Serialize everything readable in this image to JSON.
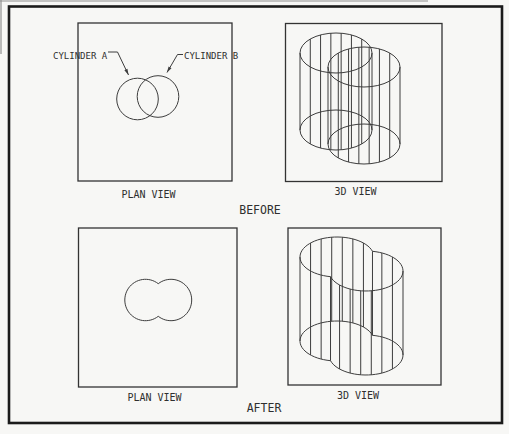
{
  "labels": {
    "cylinder_a": "CYLINDER A",
    "cylinder_b": "CYLINDER B"
  },
  "captions": {
    "before_plan": "PLAN VIEW",
    "before_3d": "3D VIEW",
    "before": "BEFORE",
    "after_plan": "PLAN VIEW",
    "after_3d": "3D VIEW",
    "after": "AFTER"
  },
  "colors": {
    "line": "#3d3d3d",
    "frame": "#333333",
    "border": "#1b1b1b",
    "background": "#f7f7f5",
    "text": "#2f2f2f"
  },
  "geometry": {
    "canvas": {
      "w": 509,
      "h": 434
    },
    "border": {
      "x": 9,
      "y": 6.5,
      "w": 493,
      "h": 416.5
    },
    "panels": {
      "before_plan": {
        "x": 78,
        "y": 23,
        "w": 154,
        "h": 158
      },
      "before_3d": {
        "x": 285.5,
        "y": 23.5,
        "w": 156.5,
        "h": 158
      },
      "after_plan": {
        "x": 78.5,
        "y": 228,
        "w": 158.5,
        "h": 159
      },
      "after_3d": {
        "x": 288,
        "y": 228,
        "w": 153,
        "h": 157
      }
    },
    "before_plan": {
      "circles": [
        {
          "cx": 137.5,
          "cy": 99,
          "r": 20.8
        },
        {
          "cx": 158,
          "cy": 96.5,
          "r": 20.8
        }
      ]
    },
    "after_plan": {
      "union": true,
      "circles": [
        {
          "cx": 145.5,
          "cy": 300,
          "r": 20.7
        },
        {
          "cx": 171,
          "cy": 300,
          "r": 20.7
        }
      ]
    },
    "before_3d": {
      "rx": 36,
      "ry": 20,
      "facets": 8,
      "union": false,
      "cylinders": [
        {
          "cx": 336,
          "yTop": 53,
          "yBot": 130
        },
        {
          "cx": 364,
          "yTop": 67,
          "yBot": 144
        }
      ]
    },
    "after_3d": {
      "rx": 37,
      "ry": 20,
      "facets": 8,
      "union": true,
      "cylinders": [
        {
          "cx": 337,
          "yTop": 257,
          "yBot": 341
        },
        {
          "cx": 366,
          "yTop": 271,
          "yBot": 355
        }
      ]
    },
    "leaders": [
      {
        "pts": [
          [
            108,
            52
          ],
          [
            117.5,
            52
          ],
          [
            128.5,
            75
          ]
        ]
      },
      {
        "pts": [
          [
            183,
            54.5
          ],
          [
            177.5,
            54.5
          ],
          [
            167,
            72.5
          ]
        ]
      }
    ],
    "text_pos": {
      "cylinder_a": {
        "x": 53,
        "y": 58.5,
        "anchor": "start",
        "size": 9
      },
      "cylinder_b": {
        "x": 184,
        "y": 58.5,
        "anchor": "start",
        "size": 9
      },
      "before_plan": {
        "x": 148.5,
        "y": 197.5,
        "anchor": "middle",
        "size": 10
      },
      "before_3d": {
        "x": 355.5,
        "y": 194.5,
        "anchor": "middle",
        "size": 10
      },
      "before": {
        "x": 260,
        "y": 213.5,
        "anchor": "middle",
        "size": 11.5
      },
      "after_plan": {
        "x": 154.5,
        "y": 401,
        "anchor": "middle",
        "size": 10
      },
      "after_3d": {
        "x": 358,
        "y": 398.5,
        "anchor": "middle",
        "size": 10
      },
      "after": {
        "x": 264,
        "y": 412,
        "anchor": "middle",
        "size": 11.5
      }
    }
  }
}
